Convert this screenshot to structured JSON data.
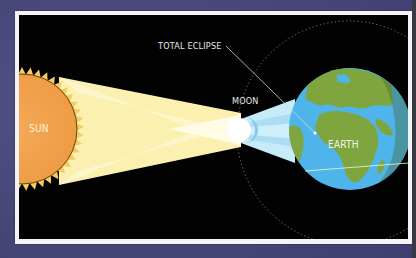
{
  "diagram": {
    "labels": {
      "total_eclipse": "TOTAL ECLIPSE",
      "moon": "MOON",
      "sun": "SUN",
      "earth": "EARTH"
    },
    "bodies": [
      {
        "name": "Sun",
        "color": "#f2a24c",
        "ray_color": "#f3cf63"
      },
      {
        "name": "Moon",
        "color": "#ffffff"
      },
      {
        "name": "Earth",
        "ocean_color": "#4fb4ea",
        "land_color": "#7fa53e",
        "night_side_color": "#5f8a2e"
      }
    ],
    "colors": {
      "background": "#4b4a7c",
      "frame": "#f4f3f6",
      "panel": "#020202",
      "light_beam": "#fbf1b4",
      "light_beam_inner": "#fff9d8",
      "shadow_cone": "#bfe8f7",
      "umbra": "#8fd0f0",
      "orbit": "#8a8a8a",
      "label": "#e9e9e9"
    }
  }
}
